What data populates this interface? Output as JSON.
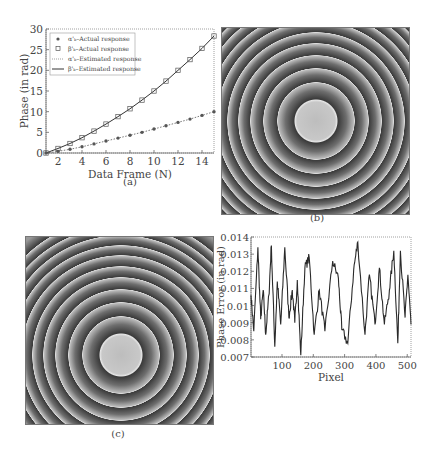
{
  "chart_data": [
    {
      "id": "a",
      "type": "line",
      "caption": "(a)",
      "xlabel": "Data Frame (N)",
      "ylabel": "Phase (in rad)",
      "xlim": [
        1,
        15
      ],
      "ylim": [
        0,
        30
      ],
      "xticks": [
        2,
        4,
        6,
        8,
        10,
        12,
        14
      ],
      "yticks": [
        0,
        5,
        10,
        15,
        20,
        25,
        30
      ],
      "grid": false,
      "legend_position": "upper left",
      "x": [
        1,
        2,
        3,
        4,
        5,
        6,
        7,
        8,
        9,
        10,
        11,
        12,
        13,
        14,
        15
      ],
      "series": [
        {
          "name": "α'ₖ–Actual response",
          "marker": "asterisk",
          "line": "none",
          "values": [
            0,
            0.4,
            0.9,
            1.5,
            2.2,
            2.9,
            3.6,
            4.3,
            5.0,
            5.8,
            6.6,
            7.4,
            8.2,
            9.1,
            10.0
          ]
        },
        {
          "name": "β'ₖ–Actual response",
          "marker": "square",
          "line": "none",
          "values": [
            0,
            1.1,
            2.3,
            3.7,
            5.3,
            7.0,
            8.8,
            10.7,
            12.8,
            15.0,
            17.4,
            20.0,
            22.6,
            25.3,
            28.3
          ]
        },
        {
          "name": "α'ₖ–Estimated response",
          "marker": "none",
          "line": "dotted",
          "values": [
            0,
            0.4,
            0.9,
            1.5,
            2.2,
            2.9,
            3.6,
            4.3,
            5.0,
            5.8,
            6.6,
            7.4,
            8.2,
            9.1,
            10.0
          ]
        },
        {
          "name": "β'ₖ–Estimated response",
          "marker": "none",
          "line": "solid",
          "values": [
            0,
            1.1,
            2.3,
            3.7,
            5.3,
            7.0,
            8.8,
            10.7,
            12.8,
            15.0,
            17.4,
            20.0,
            22.6,
            25.3,
            28.3
          ]
        }
      ]
    },
    {
      "id": "b",
      "type": "heatmap",
      "caption": "(b)",
      "description": "Wrapped phase map: concentric circular fringes with a bright noisy central disc"
    },
    {
      "id": "c",
      "type": "heatmap",
      "caption": "(c)",
      "description": "Wrapped phase map: concentric circular fringes with a bright noisy central disc"
    },
    {
      "id": "d",
      "type": "line",
      "caption": "(d)",
      "xlabel": "Pixel",
      "ylabel": "Phase Error (in rad)",
      "xlim": [
        1,
        512
      ],
      "ylim": [
        0.007,
        0.014
      ],
      "xticks": [
        100,
        200,
        300,
        400,
        500
      ],
      "yticks": [
        0.007,
        0.008,
        0.009,
        0.01,
        0.011,
        0.012,
        0.013,
        0.014
      ],
      "ytick_labels": [
        "0.007",
        "0.008",
        "0.009",
        "0.01",
        "0.011",
        "0.012",
        "0.013",
        "0.014"
      ],
      "grid": false,
      "x": [
        1,
        10,
        23,
        32,
        40,
        48,
        58,
        66,
        77,
        85,
        96,
        109,
        122,
        133,
        141,
        149,
        160,
        173,
        187,
        203,
        219,
        237,
        262,
        280,
        291,
        310,
        329,
        342,
        365,
        379,
        397,
        411,
        427,
        443,
        457,
        470,
        478,
        493,
        502,
        512
      ],
      "series": [
        {
          "name": "Phase error",
          "values": [
            0.0106,
            0.0085,
            0.0134,
            0.0092,
            0.0109,
            0.0083,
            0.0106,
            0.0135,
            0.0076,
            0.0114,
            0.0089,
            0.0134,
            0.0093,
            0.0109,
            0.009,
            0.0115,
            0.0071,
            0.0122,
            0.0128,
            0.0083,
            0.0109,
            0.0085,
            0.0126,
            0.0116,
            0.0086,
            0.0078,
            0.0121,
            0.0137,
            0.0083,
            0.0118,
            0.0089,
            0.0122,
            0.0089,
            0.0109,
            0.0132,
            0.0078,
            0.0132,
            0.0093,
            0.0118,
            0.0089
          ]
        }
      ]
    }
  ]
}
